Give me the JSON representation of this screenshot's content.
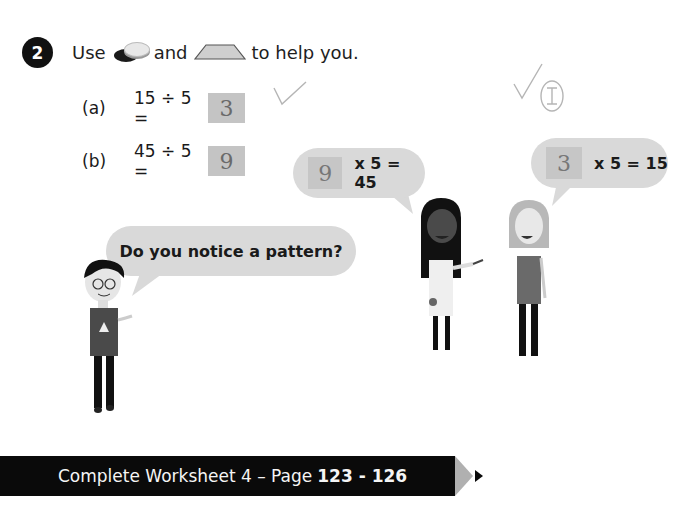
{
  "question": {
    "number": "2",
    "instruction_prefix": "Use",
    "instruction_mid": "and",
    "instruction_suffix": "to help you.",
    "icons": [
      "counters-icon",
      "trapezium-icon"
    ]
  },
  "items": [
    {
      "label": "(a)",
      "expression": "15 ÷ 5 =",
      "answer": "3"
    },
    {
      "label": "(b)",
      "expression": "45 ÷ 5 =",
      "answer": "9"
    }
  ],
  "annotations": {
    "tick_a": "✓",
    "tick_top_right": "✓",
    "circled_letter": "I"
  },
  "bubbles": {
    "boy": {
      "text": "Do you notice a pattern?"
    },
    "girl_left": {
      "answer": "9",
      "equation": "x 5 = 45"
    },
    "girl_right": {
      "answer": "3",
      "equation": "x 5 = 15"
    }
  },
  "footer": {
    "text": "Complete Worksheet 4 – Page",
    "pages": "123 - 126"
  },
  "colors": {
    "bubble": "#d9d9d9",
    "answer_box": "#c4c4c4",
    "banner": "#0a0a0a",
    "banner_tip": "#b0b0b0"
  }
}
